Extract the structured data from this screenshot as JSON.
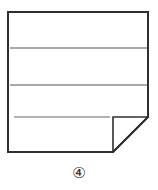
{
  "figure": {
    "caption": "④",
    "caption_plain": "4",
    "caption_style": "circled-number",
    "colors": {
      "background": "#ffffff",
      "sheet_fill": "#ffffff",
      "outline": "#2f2f2f",
      "fold_outline": "#2f2f2f",
      "rule_line": "#8c8c8c",
      "caption_text": "#2b2b2b"
    },
    "sheet": {
      "name": "paper-sheet",
      "left": 8,
      "top": 12,
      "right": 148,
      "bottom": 152,
      "outline_width": 2
    },
    "fold": {
      "name": "folded-corner",
      "corner": "bottom-right",
      "left": 113,
      "top": 117,
      "right": 148,
      "bottom": 152,
      "diagonal_from": "148,117",
      "diagonal_to": "113,152",
      "outline_width": 1.6
    },
    "rule_lines": [
      {
        "name": "rule-line-1",
        "y": 48,
        "x1": 10,
        "x2": 147,
        "width": 1.4,
        "color": "#8c8c8c"
      },
      {
        "name": "rule-line-2",
        "y": 85,
        "x1": 10,
        "x2": 147,
        "width": 1.4,
        "color": "#8c8c8c"
      },
      {
        "name": "rule-line-3",
        "y": 117,
        "x1": 14,
        "x2": 110,
        "width": 1.4,
        "color": "#9a9a9a"
      }
    ]
  }
}
